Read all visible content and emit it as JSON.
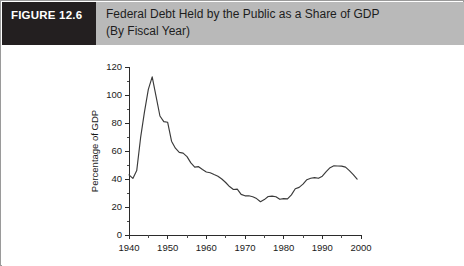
{
  "figure": {
    "tag": "FIGURE 12.6",
    "title_line1": "Federal Debt Held by the Public as a Share of GDP",
    "title_line2": "(By Fiscal Year)",
    "tag_bg": "#231f20",
    "title_bg": "#b9b9b9",
    "border_color": "#9a9a9a"
  },
  "chart_data": {
    "type": "line",
    "title": "Federal Debt Held by the Public as a Share of GDP (By Fiscal Year)",
    "xlabel": "",
    "ylabel": "Percentage of GDP",
    "xlim": [
      1940,
      2000
    ],
    "ylim": [
      0,
      120
    ],
    "grid": false,
    "legend": "none",
    "line_color": "#3a3a3a",
    "x_ticks_major": [
      1940,
      1950,
      1960,
      1970,
      1980,
      1990,
      2000
    ],
    "x_tick_labels": [
      "1940",
      "1950",
      "1960",
      "1970",
      "1980",
      "1990",
      "2000"
    ],
    "x_ticks_minor": [
      1945,
      1955,
      1965,
      1975,
      1985,
      1995
    ],
    "y_ticks_major": [
      0,
      20,
      40,
      60,
      80,
      100,
      120
    ],
    "y_tick_labels": [
      "0",
      "20",
      "40",
      "60",
      "80",
      "100",
      "120"
    ],
    "y_ticks_minor": [
      10,
      30,
      50,
      70,
      90,
      110
    ],
    "series": [
      {
        "name": "Federal debt held by the public",
        "x": [
          1940,
          1941,
          1942,
          1943,
          1944,
          1945,
          1946,
          1947,
          1948,
          1949,
          1950,
          1951,
          1952,
          1953,
          1954,
          1955,
          1956,
          1957,
          1958,
          1959,
          1960,
          1961,
          1962,
          1963,
          1964,
          1965,
          1966,
          1967,
          1968,
          1969,
          1970,
          1971,
          1972,
          1973,
          1974,
          1975,
          1976,
          1977,
          1978,
          1979,
          1980,
          1981,
          1982,
          1983,
          1984,
          1985,
          1986,
          1987,
          1988,
          1989,
          1990,
          1991,
          1992,
          1993,
          1994,
          1995,
          1996,
          1997,
          1998,
          1999
        ],
        "values": [
          43.0,
          40.4,
          46.0,
          69.5,
          88.0,
          104.0,
          113.0,
          99.0,
          85.0,
          81.0,
          80.5,
          67.0,
          62.0,
          59.0,
          58.5,
          56.0,
          51.5,
          48.5,
          48.8,
          46.8,
          45.0,
          44.5,
          43.2,
          42.0,
          40.0,
          37.5,
          34.6,
          32.5,
          32.8,
          29.0,
          28.0,
          28.0,
          27.3,
          26.0,
          23.8,
          25.3,
          27.5,
          27.8,
          27.3,
          25.5,
          26.0,
          25.8,
          28.7,
          33.0,
          34.0,
          36.3,
          39.5,
          40.5,
          41.0,
          40.5,
          42.0,
          45.3,
          48.1,
          49.4,
          49.3,
          49.2,
          48.5,
          46.0,
          43.1,
          39.9
        ]
      }
    ]
  }
}
